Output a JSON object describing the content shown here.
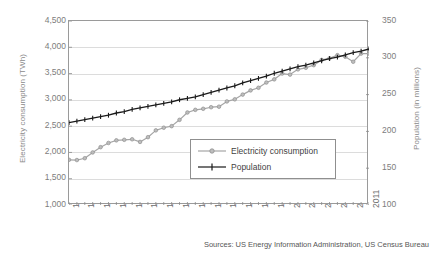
{
  "chart_data": {
    "type": "line",
    "title": "",
    "xlabel": "",
    "ylabel": "Electricity consumption (TWh)",
    "y2label": "Population (in millions)",
    "grid": true,
    "legend_position": "center-right-inside",
    "ylim": [
      1000,
      4500
    ],
    "y2lim": [
      100,
      350
    ],
    "xlim": [
      1973,
      2011
    ],
    "yticks": [
      "4,500",
      "4,000",
      "3,500",
      "3,000",
      "2,500",
      "2,000",
      "1,500",
      "1,000"
    ],
    "ytick_values": [
      4500,
      4000,
      3500,
      3000,
      2500,
      2000,
      1500,
      1000
    ],
    "y2ticks": [
      "350",
      "300",
      "250",
      "200",
      "150",
      "100"
    ],
    "y2tick_values": [
      350,
      300,
      250,
      200,
      150,
      100
    ],
    "xticks": [
      "1973",
      "1975",
      "1977",
      "1979",
      "1981",
      "1983",
      "1985",
      "1987",
      "1989",
      "1991",
      "1993",
      "1995",
      "1997",
      "1999",
      "2001",
      "2003",
      "2005",
      "2007",
      "2009",
      "2011"
    ],
    "x": [
      1973,
      1974,
      1975,
      1976,
      1977,
      1978,
      1979,
      1980,
      1981,
      1982,
      1983,
      1984,
      1985,
      1986,
      1987,
      1988,
      1989,
      1990,
      1991,
      1992,
      1993,
      1994,
      1995,
      1996,
      1997,
      1998,
      1999,
      2000,
      2001,
      2002,
      2003,
      2004,
      2005,
      2006,
      2007,
      2008,
      2009,
      2010,
      2011
    ],
    "series": [
      {
        "name": "Electricity consumption",
        "axis": "left",
        "unit": "TWh",
        "color": "#a6a6a6",
        "marker": "circle",
        "values": [
          1860,
          1855,
          1890,
          2000,
          2100,
          2180,
          2230,
          2240,
          2250,
          2200,
          2290,
          2420,
          2470,
          2500,
          2620,
          2760,
          2810,
          2830,
          2860,
          2870,
          2970,
          3010,
          3100,
          3180,
          3230,
          3330,
          3390,
          3500,
          3480,
          3580,
          3610,
          3660,
          3760,
          3790,
          3850,
          3820,
          3725,
          3880,
          3880
        ]
      },
      {
        "name": "Population",
        "axis": "right",
        "unit": "millions",
        "color": "#1a1a1a",
        "marker": "plus",
        "values": [
          212,
          214,
          216,
          218,
          220,
          222,
          225,
          227,
          230,
          232,
          234,
          236,
          238,
          240,
          243,
          245,
          247,
          250,
          253,
          256,
          259,
          262,
          266,
          269,
          272,
          275,
          279,
          282,
          285,
          288,
          290,
          293,
          296,
          299,
          301,
          304,
          307,
          309,
          312
        ]
      }
    ],
    "annotations": {
      "source": "Sources: US Energy Information Administration, US Census Bureau"
    }
  },
  "legend": {
    "items": [
      {
        "label": "Electricity consumption"
      },
      {
        "label": "Population"
      }
    ]
  },
  "source": {
    "text": "Sources: US Energy Information Administration, US Census Bureau"
  }
}
